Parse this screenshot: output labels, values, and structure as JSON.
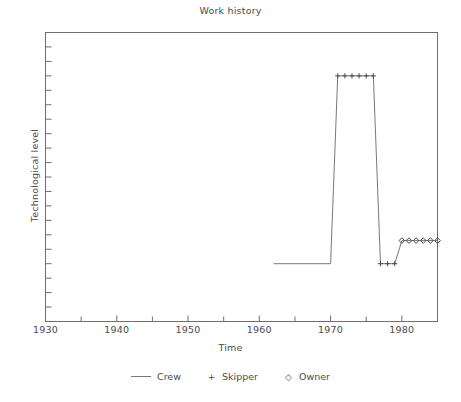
{
  "chart_data": {
    "type": "line",
    "title": "Work history",
    "xlabel": "Time",
    "ylabel": "Technological level",
    "xlim": [
      1930,
      1985
    ],
    "ylim": [
      0,
      10
    ],
    "grid": false,
    "legend_position": "bottom",
    "x_ticks_major": [
      1930,
      1940,
      1950,
      1960,
      1970,
      1980
    ],
    "x_tick_labels": [
      "1930",
      "1940",
      "1950",
      "1960",
      "1970",
      "1980"
    ],
    "x_ticks_minor": [
      1935,
      1945,
      1955,
      1965,
      1975,
      1985
    ],
    "y_ticks_count": 19,
    "y_tick_labels": [],
    "series": [
      {
        "name": "Crew",
        "marker": "line",
        "x": [
          1962,
          1970,
          1971,
          1976,
          1977,
          1979,
          1980,
          1985
        ],
        "y": [
          2.0,
          2.0,
          8.5,
          8.5,
          2.0,
          2.0,
          2.8,
          2.8
        ]
      },
      {
        "name": "Skipper",
        "marker": "plus",
        "x": [
          1971,
          1972,
          1973,
          1974,
          1975,
          1976,
          1977,
          1978,
          1979
        ],
        "y": [
          8.5,
          8.5,
          8.5,
          8.5,
          8.5,
          8.5,
          2.0,
          2.0,
          2.0
        ]
      },
      {
        "name": "Owner",
        "marker": "diamond",
        "x": [
          1980,
          1981,
          1982,
          1983,
          1984,
          1985
        ],
        "y": [
          2.8,
          2.8,
          2.8,
          2.8,
          2.8,
          2.8
        ]
      }
    ]
  },
  "legend": {
    "entries": [
      {
        "label": "Crew",
        "glyph": "line-glyph"
      },
      {
        "label": "Skipper",
        "glyph": "+"
      },
      {
        "label": "Owner",
        "glyph": "◇"
      }
    ]
  },
  "axes": {
    "title": "Work history",
    "x_label": "Time",
    "y_label": "Technological level",
    "x_tick_labels": [
      "1930",
      "1940",
      "1950",
      "1960",
      "1970",
      "1980"
    ]
  },
  "colors": {
    "axis": "#6e6e6e",
    "line": "#7a7a7a",
    "marker": "#4a4a4a",
    "text": "#4a4a4a",
    "background": "#ffffff"
  }
}
